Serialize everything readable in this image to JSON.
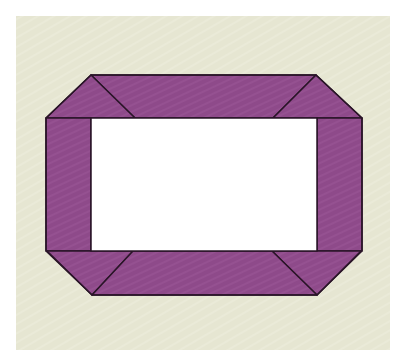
{
  "diagram": {
    "title": "",
    "colors": {
      "page_background": "#ffffff",
      "panel_background": "#e6e6d2",
      "frame_fill": "#8e4a8a",
      "frame_stroke": "#2a1528",
      "window_fill": "#ffffff"
    },
    "panel": {
      "x": 16,
      "y": 16,
      "width": 374,
      "height": 334
    },
    "frame": {
      "outer_octagon": [
        [
          91,
          75
        ],
        [
          316,
          75
        ],
        [
          362,
          118
        ],
        [
          362,
          250
        ],
        [
          317,
          295
        ],
        [
          92,
          295
        ],
        [
          46,
          250
        ],
        [
          46,
          118
        ]
      ],
      "inner_window": {
        "x": 91,
        "y": 118,
        "width": 226,
        "height": 133
      },
      "pieces": [
        {
          "name": "top-rail",
          "points": [
            [
              91,
              75
            ],
            [
              316,
              75
            ],
            [
              273,
              118
            ],
            [
              135,
              118
            ]
          ]
        },
        {
          "name": "top-left-corner",
          "points": [
            [
              91,
              75
            ],
            [
              135,
              118
            ],
            [
              46,
              118
            ]
          ]
        },
        {
          "name": "top-right-corner",
          "points": [
            [
              316,
              75
            ],
            [
              362,
              118
            ],
            [
              273,
              118
            ]
          ]
        },
        {
          "name": "left-stile",
          "points": [
            [
              46,
              118
            ],
            [
              91,
              118
            ],
            [
              91,
              251
            ],
            [
              46,
              251
            ]
          ]
        },
        {
          "name": "right-stile",
          "points": [
            [
              317,
              118
            ],
            [
              362,
              118
            ],
            [
              362,
              251
            ],
            [
              317,
              251
            ]
          ]
        },
        {
          "name": "bottom-left-corner",
          "points": [
            [
              46,
              251
            ],
            [
              133,
              251
            ],
            [
              92,
              295
            ]
          ]
        },
        {
          "name": "bottom-right-corner",
          "points": [
            [
              272,
              251
            ],
            [
              362,
              251
            ],
            [
              317,
              295
            ]
          ]
        },
        {
          "name": "bottom-rail",
          "points": [
            [
              133,
              251
            ],
            [
              272,
              251
            ],
            [
              317,
              295
            ],
            [
              92,
              295
            ]
          ]
        }
      ]
    }
  }
}
